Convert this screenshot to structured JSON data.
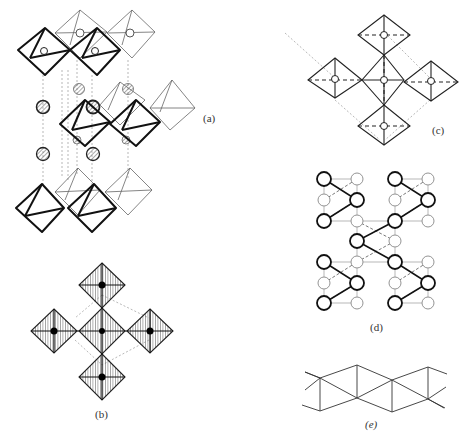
{
  "figure": {
    "panels": [
      {
        "id": "a",
        "label": "(a)",
        "description": "Layered perovskite structure: sheets of corner-sharing octahedra separated by cation layers (hatched spheres)"
      },
      {
        "id": "b",
        "label": "(b)",
        "description": "Top view of corner-sharing shaded octahedra with central black cations"
      },
      {
        "id": "c",
        "label": "(c)",
        "description": "Top view of corner-sharing octahedra with open-circle centers and dashed axes"
      },
      {
        "id": "d",
        "label": "(d)",
        "description": "Network of bold and light circles linked by solid and dashed lines"
      },
      {
        "id": "e",
        "label": "(e)",
        "description": "Zig-zag chain of edge-linked triangles"
      }
    ]
  },
  "colors": {
    "line": "#111111",
    "light_line": "#888888",
    "hatch_fill": "#bbbbbb",
    "background": "#ffffff"
  }
}
